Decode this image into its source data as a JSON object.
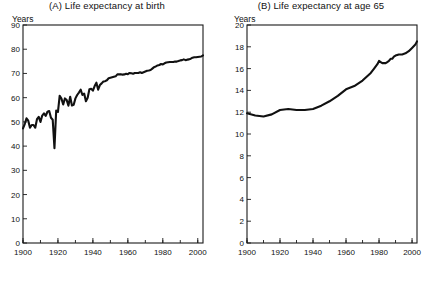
{
  "figure": {
    "background": "#ffffff",
    "line_color": "#111111",
    "axis_color": "#1a1a1a"
  },
  "panels": [
    {
      "key": "a",
      "title": "(A) Life expectancy at birth",
      "yaxis_unit": "Years"
    },
    {
      "key": "b",
      "title": "(B) Life expectancy at age 65",
      "yaxis_unit": "Years"
    }
  ],
  "chart_data": [
    {
      "type": "line",
      "title": "(A) Life expectancy at birth",
      "xlabel": "",
      "ylabel": "Years",
      "xlim": [
        1900,
        2003
      ],
      "ylim": [
        0,
        90
      ],
      "yticks": [
        0,
        10,
        20,
        30,
        40,
        50,
        60,
        70,
        80,
        90
      ],
      "xticks": [
        1900,
        1920,
        1940,
        1960,
        1980,
        2000
      ],
      "xminor_step": 10,
      "grid": false,
      "legend": "none",
      "series": [
        {
          "name": "Life expectancy at birth",
          "x": [
            1900,
            1901,
            1902,
            1903,
            1904,
            1905,
            1906,
            1907,
            1908,
            1909,
            1910,
            1911,
            1912,
            1913,
            1914,
            1915,
            1916,
            1917,
            1918,
            1919,
            1920,
            1921,
            1922,
            1923,
            1924,
            1925,
            1926,
            1927,
            1928,
            1929,
            1930,
            1931,
            1932,
            1933,
            1934,
            1935,
            1936,
            1937,
            1938,
            1939,
            1940,
            1941,
            1942,
            1943,
            1944,
            1945,
            1946,
            1947,
            1948,
            1949,
            1950,
            1951,
            1952,
            1953,
            1954,
            1955,
            1956,
            1957,
            1958,
            1959,
            1960,
            1961,
            1962,
            1963,
            1964,
            1965,
            1966,
            1967,
            1968,
            1969,
            1970,
            1971,
            1972,
            1973,
            1974,
            1975,
            1976,
            1977,
            1978,
            1979,
            1980,
            1981,
            1982,
            1983,
            1984,
            1985,
            1986,
            1987,
            1988,
            1989,
            1990,
            1991,
            1992,
            1993,
            1994,
            1995,
            1996,
            1997,
            1998,
            1999,
            2000,
            2001,
            2002,
            2003
          ],
          "values": [
            47.3,
            49.1,
            51.5,
            50.5,
            47.6,
            48.7,
            48.7,
            47.6,
            51.1,
            52.1,
            50.0,
            52.6,
            53.5,
            52.5,
            54.2,
            54.5,
            51.7,
            50.9,
            39.1,
            54.7,
            54.1,
            60.8,
            59.6,
            57.2,
            59.7,
            59.0,
            56.7,
            60.4,
            56.8,
            57.1,
            59.7,
            61.1,
            62.1,
            63.3,
            61.1,
            61.7,
            58.5,
            60.0,
            63.5,
            63.7,
            62.9,
            64.8,
            66.2,
            63.3,
            65.2,
            65.9,
            66.7,
            66.8,
            67.2,
            68.0,
            68.2,
            68.4,
            68.6,
            68.8,
            69.6,
            69.6,
            69.7,
            69.5,
            69.6,
            69.9,
            69.7,
            70.2,
            70.1,
            69.9,
            70.2,
            70.2,
            70.2,
            70.5,
            70.2,
            70.5,
            70.8,
            71.1,
            71.2,
            71.4,
            72.0,
            72.6,
            72.9,
            73.3,
            73.5,
            73.9,
            73.7,
            74.2,
            74.5,
            74.6,
            74.7,
            74.7,
            74.7,
            74.9,
            74.9,
            75.1,
            75.4,
            75.5,
            75.8,
            75.5,
            75.7,
            75.8,
            76.1,
            76.5,
            76.7,
            76.7,
            76.8,
            76.9,
            77.0,
            77.5
          ]
        }
      ]
    },
    {
      "type": "line",
      "title": "(B) Life expectancy at age 65",
      "xlabel": "",
      "ylabel": "Years",
      "xlim": [
        1900,
        2003
      ],
      "ylim": [
        0,
        20
      ],
      "yticks": [
        0,
        2,
        4,
        6,
        8,
        10,
        12,
        14,
        16,
        18,
        20
      ],
      "xticks": [
        1900,
        1920,
        1940,
        1960,
        1980,
        2000
      ],
      "xminor_step": 10,
      "grid": false,
      "legend": "none",
      "series": [
        {
          "name": "Life expectancy at age 65",
          "x": [
            1900,
            1905,
            1910,
            1915,
            1920,
            1925,
            1930,
            1935,
            1940,
            1945,
            1950,
            1955,
            1960,
            1965,
            1970,
            1975,
            1977,
            1979,
            1980,
            1981,
            1982,
            1983,
            1984,
            1985,
            1986,
            1987,
            1988,
            1989,
            1990,
            1992,
            1994,
            1996,
            1998,
            2000,
            2002,
            2003
          ],
          "values": [
            11.9,
            11.7,
            11.6,
            11.8,
            12.2,
            12.3,
            12.2,
            12.2,
            12.3,
            12.6,
            13.0,
            13.5,
            14.1,
            14.4,
            14.9,
            15.6,
            16.0,
            16.4,
            16.7,
            16.6,
            16.5,
            16.5,
            16.5,
            16.6,
            16.7,
            16.9,
            16.9,
            17.1,
            17.2,
            17.3,
            17.3,
            17.4,
            17.6,
            17.9,
            18.2,
            18.5
          ]
        }
      ]
    }
  ]
}
